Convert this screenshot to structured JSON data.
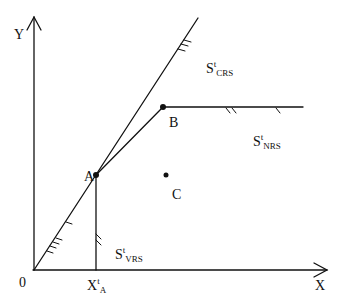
{
  "diagram": {
    "axes": {
      "y_label": "Y",
      "x_label": "X",
      "origin_label": "0"
    },
    "points": [
      {
        "id": "A",
        "label": "A"
      },
      {
        "id": "B",
        "label": "B"
      },
      {
        "id": "C",
        "label": "C"
      }
    ],
    "tick_label": {
      "base": "X",
      "sup": "t",
      "sub": "A"
    },
    "regions": [
      {
        "id": "crs",
        "base": "S",
        "sup": "t",
        "sub": "CRS"
      },
      {
        "id": "nrs",
        "base": "S",
        "sup": "t",
        "sub": "NRS"
      },
      {
        "id": "vrs",
        "base": "S",
        "sup": "t",
        "sub": "VRS"
      }
    ],
    "colors": {
      "ink": "#111111",
      "background": "#ffffff"
    }
  }
}
